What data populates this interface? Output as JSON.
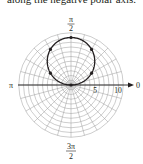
{
  "caption": "along the negative polar axis.",
  "chart_data": {
    "type": "line",
    "coordinate_system": "polar",
    "title": "",
    "equation": "r = 10 sin θ",
    "angle_labels": {
      "0": "0",
      "pi_over_2": {
        "num": "π",
        "den": "2"
      },
      "pi": "π",
      "three_pi_over_2": {
        "num": "3π",
        "den": "2"
      }
    },
    "radial_tick_labels": [
      "5",
      "10"
    ],
    "radial_ticks": [
      5,
      10
    ],
    "grid": {
      "rings_every": 1,
      "max_r": 11,
      "spokes_every_deg": 15
    },
    "series": [
      {
        "name": "r = 10 sin θ",
        "theta": [
          "0",
          "π/6",
          "π/3",
          "π/2",
          "2π/3",
          "5π/6",
          "π"
        ],
        "r": [
          0,
          5,
          8.66,
          10,
          8.66,
          5,
          0
        ],
        "points_marked": true
      }
    ],
    "rlim": [
      0,
      11
    ]
  },
  "colors": {
    "grid": "#9a9a9a",
    "curve": "#231f20",
    "axis": "#231f20"
  }
}
